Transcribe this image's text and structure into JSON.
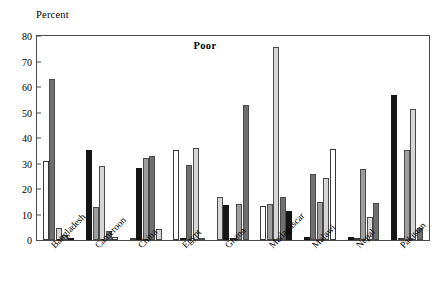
{
  "chart_data": {
    "type": "bar",
    "title": "Poor",
    "ylabel": "Percent",
    "xlabel": "",
    "ylim": [
      0,
      80
    ],
    "yticks": [
      0,
      10,
      20,
      30,
      40,
      50,
      60,
      70,
      80
    ],
    "grid": false,
    "legend": "none",
    "categories": [
      "Bangladesh",
      "Cameroon",
      "China",
      "Egypt",
      "Ghana",
      "Madagascar",
      "Malawi",
      "Nepal",
      "Pakistan"
    ],
    "series": [
      {
        "name": "series-1",
        "fill": "white",
        "values": [
          30.8,
          1.2,
          0.2,
          35.4,
          0.3,
          13.3,
          35.6,
          0.3,
          0.2
        ]
      },
      {
        "name": "series-2",
        "fill": "dark",
        "values": [
          63.2,
          3.5,
          32.8,
          29.4,
          52.9,
          16.8,
          26.0,
          14.5,
          4.7
        ]
      },
      {
        "name": "series-3",
        "fill": "light",
        "values": [
          4.8,
          29.0,
          4.2,
          35.9,
          17.0,
          75.8,
          24.2,
          9.0,
          51.5
        ]
      },
      {
        "name": "series-4",
        "fill": "mid",
        "values": [
          2.1,
          13.1,
          32.0,
          0.6,
          14.0,
          14.3,
          14.8,
          28.0,
          35.3
        ]
      },
      {
        "name": "series-5",
        "fill": "black",
        "values": [
          0.2,
          35.2,
          28.2,
          0.2,
          13.8,
          11.3,
          1.3,
          1.2,
          56.8
        ]
      }
    ],
    "bar_order": [
      [
        "white",
        "dark",
        "light",
        "mid",
        "black"
      ],
      [
        "black",
        "mid",
        "light",
        "dark",
        "white"
      ],
      [
        "white",
        "black",
        "mid",
        "dark",
        "light"
      ],
      [
        "white",
        "black",
        "dark",
        "light",
        "mid"
      ],
      [
        "light",
        "black",
        "white",
        "mid",
        "dark"
      ],
      [
        "white",
        "mid",
        "light",
        "dark",
        "black"
      ],
      [
        "black",
        "dark",
        "mid",
        "light",
        "white"
      ],
      [
        "black",
        "white",
        "mid",
        "light",
        "dark"
      ],
      [
        "black",
        "white",
        "mid",
        "light",
        "dark"
      ]
    ]
  }
}
